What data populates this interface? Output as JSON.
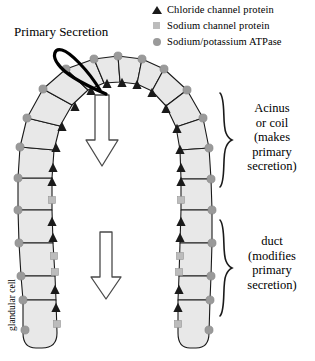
{
  "figure": {
    "title": "Primary Secretion",
    "glandular_cell_label": "glandular cell"
  },
  "legend": {
    "items": [
      {
        "icon": "triangle-marker-icon",
        "label": "Chloride channel protein",
        "color": "#1a1a1a",
        "shape": "triangle"
      },
      {
        "icon": "square-marker-icon",
        "label": "Sodium channel protein",
        "color": "#bcbcbc",
        "shape": "square"
      },
      {
        "icon": "circle-marker-icon",
        "label": "Sodium/potassium ATPase",
        "color": "#9a9a9a",
        "shape": "circle"
      }
    ]
  },
  "regions": {
    "acinus": {
      "lines": [
        "Acinus",
        "or coil",
        "(makes",
        "primary",
        "secretion)"
      ],
      "text": "Acinus or coil (makes primary secretion)"
    },
    "duct": {
      "lines": [
        "duct",
        "(modifies",
        "primary",
        "secretion)"
      ],
      "text": "duct (modifies primary secretion)"
    }
  },
  "colors": {
    "cell_fill": "#e8e8e8",
    "cell_stroke": "#1a1a1a",
    "chloride_triangle": "#1a1a1a",
    "sodium_square": "#bcbcbc",
    "atpase_circle": "#9a9a9a",
    "arrow_fill": "#ffffff",
    "arrow_stroke": "#4a4a4a",
    "pointer_loop": "#000000",
    "background": "#ffffff"
  },
  "flow_arrows": [
    {
      "name": "primary-secretion-flow-arrow",
      "direction": "down",
      "location": "acinus lumen"
    },
    {
      "name": "duct-flow-arrow",
      "direction": "down",
      "location": "duct lumen"
    }
  ]
}
